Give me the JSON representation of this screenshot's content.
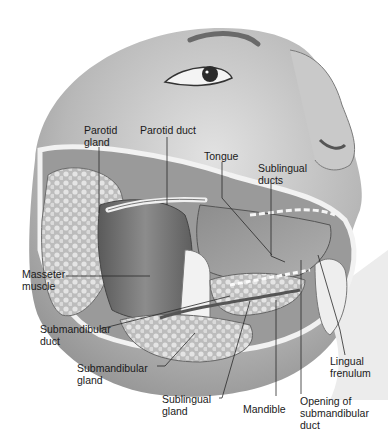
{
  "figure": {
    "colors": {
      "skin_light": "#e6e6e6",
      "skin_mid": "#bdbdbd",
      "skin_dark": "#8a8a8a",
      "gland": "#d2d2d2",
      "muscle": "#7a7a7a",
      "text": "#1a1a1a",
      "leader": "#2a2a2a"
    }
  },
  "labels": [
    {
      "id": "parotid-gland",
      "lines": [
        "Parotid",
        "gland"
      ]
    },
    {
      "id": "parotid-duct",
      "lines": [
        "Parotid duct"
      ]
    },
    {
      "id": "tongue",
      "lines": [
        "Tongue"
      ]
    },
    {
      "id": "sublingual-ducts",
      "lines": [
        "Sublingual",
        "ducts"
      ]
    },
    {
      "id": "masseter-muscle",
      "lines": [
        "Masseter",
        "muscle"
      ]
    },
    {
      "id": "submandibular-duct",
      "lines": [
        "Submandibular",
        "duct"
      ]
    },
    {
      "id": "submandibular-gland",
      "lines": [
        "Submandibular",
        "gland"
      ]
    },
    {
      "id": "sublingual-gland",
      "lines": [
        "Sublingual",
        "gland"
      ]
    },
    {
      "id": "mandible",
      "lines": [
        "Mandible"
      ]
    },
    {
      "id": "opening-submandibular-duct",
      "lines": [
        "Opening of",
        "submandibular",
        "duct"
      ]
    },
    {
      "id": "lingual-frenulum",
      "lines": [
        "Lingual",
        "frenulum"
      ]
    }
  ]
}
